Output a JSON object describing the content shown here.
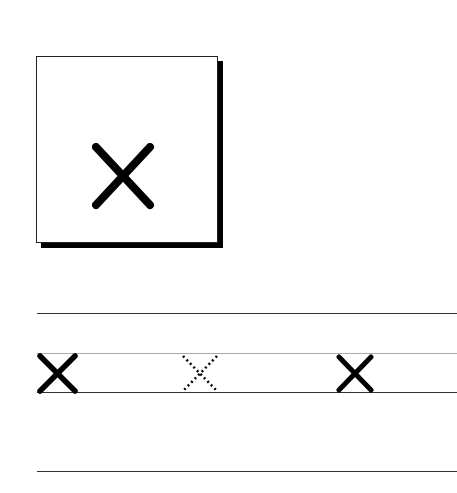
{
  "worksheet": {
    "letter": "x",
    "flashcard": {
      "letter": "x"
    },
    "tracing_row": {
      "letters": [
        {
          "style": "solid",
          "letter": "x"
        },
        {
          "style": "dotted",
          "letter": "x"
        },
        {
          "style": "solid",
          "letter": "x"
        }
      ]
    },
    "colors": {
      "ink": "#000000",
      "guide_line": "#333333",
      "midline": "#aaaaaa"
    }
  }
}
